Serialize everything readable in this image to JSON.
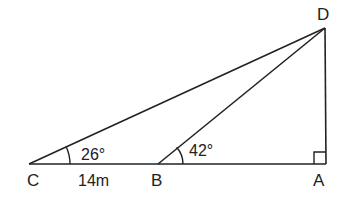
{
  "diagram": {
    "type": "right-triangle geometry figure",
    "colors": {
      "stroke": "#222222",
      "background": "#ffffff"
    },
    "points": {
      "C": {
        "label": "C"
      },
      "B": {
        "label": "B"
      },
      "A": {
        "label": "A"
      },
      "D": {
        "label": "D"
      }
    },
    "angles": {
      "C": {
        "label": "26°"
      },
      "B": {
        "label": "42°"
      },
      "A": {
        "marker": "right-angle"
      }
    },
    "measurements": {
      "CB": {
        "label": "14m"
      }
    },
    "segments": [
      "CA",
      "CD",
      "BD",
      "AD"
    ]
  }
}
